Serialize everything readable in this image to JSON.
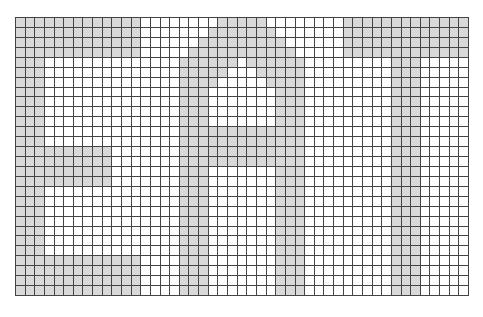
{
  "diagram": {
    "type": "pixel-grid",
    "word": "EAT",
    "columns": 47,
    "rows": 28,
    "colors": {
      "filled": "#d9d9d9",
      "empty": "#ffffff",
      "gridline": "#444444"
    },
    "letters": [
      {
        "char": "E",
        "rects": [
          {
            "col": 0,
            "row": 0,
            "w": 13,
            "h": 4
          },
          {
            "col": 0,
            "row": 0,
            "w": 3,
            "h": 28
          },
          {
            "col": 0,
            "row": 13,
            "w": 10,
            "h": 4
          },
          {
            "col": 0,
            "row": 24,
            "w": 13,
            "h": 4
          }
        ]
      },
      {
        "char": "A",
        "rows": [
          {
            "row": 0,
            "from": 21,
            "to": 25,
            "holes": []
          },
          {
            "row": 1,
            "from": 20,
            "to": 26,
            "holes": []
          },
          {
            "row": 2,
            "from": 19,
            "to": 27,
            "holes": []
          },
          {
            "row": 3,
            "from": 18,
            "to": 28,
            "holes": []
          },
          {
            "row": 4,
            "from": 17,
            "to": 29,
            "holes": [
              [
                23,
                23
              ]
            ]
          },
          {
            "row": 5,
            "from": 17,
            "to": 29,
            "holes": [
              [
                22,
                24
              ]
            ]
          },
          {
            "row": 6,
            "from": 17,
            "to": 29,
            "holes": [
              [
                21,
                25
              ]
            ]
          }
        ],
        "rects": [
          {
            "col": 17,
            "row": 7,
            "w": 3,
            "h": 21
          },
          {
            "col": 27,
            "row": 7,
            "w": 3,
            "h": 21
          },
          {
            "col": 17,
            "row": 11,
            "w": 13,
            "h": 4
          }
        ]
      },
      {
        "char": "T",
        "rects": [
          {
            "col": 34,
            "row": 0,
            "w": 13,
            "h": 4
          },
          {
            "col": 39,
            "row": 0,
            "w": 3,
            "h": 28
          }
        ]
      }
    ]
  }
}
